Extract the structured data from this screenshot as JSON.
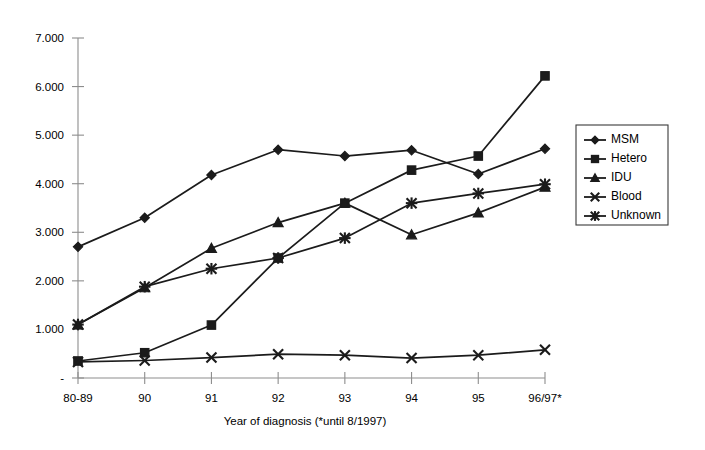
{
  "chart_data": {
    "type": "line",
    "title": "",
    "xlabel": "Year of diagnosis (*until 8/1997)",
    "ylabel": "",
    "categories": [
      "80-89",
      "90",
      "91",
      "92",
      "93",
      "94",
      "95",
      "96/97*"
    ],
    "ytick_labels": [
      "-",
      "1.000",
      "2.000",
      "3.000",
      "4.000",
      "5.000",
      "6.000",
      "7.000"
    ],
    "ytick_values": [
      0,
      1000,
      2000,
      3000,
      4000,
      5000,
      6000,
      7000
    ],
    "ylim": [
      0,
      7000
    ],
    "grid": false,
    "legend_position": "right",
    "series": [
      {
        "name": "MSM",
        "marker": "diamond",
        "values": [
          2700,
          3300,
          4180,
          4700,
          4570,
          4690,
          4200,
          4720
        ]
      },
      {
        "name": "Hetero",
        "marker": "square",
        "values": [
          350,
          520,
          1090,
          2470,
          3600,
          4280,
          4570,
          6220
        ]
      },
      {
        "name": "IDU",
        "marker": "triangle",
        "values": [
          1100,
          1860,
          2670,
          3200,
          3600,
          2950,
          3400,
          3930
        ]
      },
      {
        "name": "Blood",
        "marker": "cross",
        "values": [
          330,
          360,
          420,
          490,
          470,
          410,
          470,
          580
        ]
      },
      {
        "name": "Unknown",
        "marker": "star",
        "values": [
          1100,
          1880,
          2250,
          2470,
          2880,
          3600,
          3800,
          3990
        ]
      }
    ]
  },
  "legend": {
    "items": [
      {
        "label": "MSM"
      },
      {
        "label": "Hetero"
      },
      {
        "label": "IDU"
      },
      {
        "label": "Blood"
      },
      {
        "label": "Unknown"
      }
    ]
  }
}
